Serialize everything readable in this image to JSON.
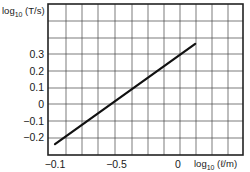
{
  "chart_data": {
    "type": "line",
    "title": "",
    "xlabel": "log10 (ℓ/m)",
    "ylabel": "log10 (T/s)",
    "x_ticks": [
      {
        "value": -1.0,
        "label": "−0.1"
      },
      {
        "value": -0.5,
        "label": "−0.5"
      },
      {
        "value": 0,
        "label": "0"
      }
    ],
    "y_ticks": [
      {
        "value": 0.3,
        "label": "0.3"
      },
      {
        "value": 0.2,
        "label": "0.2"
      },
      {
        "value": 0.1,
        "label": "0.1"
      },
      {
        "value": 0,
        "label": "0"
      },
      {
        "value": -0.1,
        "label": "−0.1"
      },
      {
        "value": -0.2,
        "label": "−0.2"
      }
    ],
    "xlim": [
      -1.06,
      0.52
    ],
    "ylim": [
      -0.3,
      0.6
    ],
    "grid": true,
    "legend": null,
    "series": [
      {
        "name": "log10 T vs log10 ℓ",
        "x": [
          -1.0,
          0.14
        ],
        "y": [
          -0.24,
          0.36
        ]
      }
    ]
  },
  "axes": {
    "ylabel_prefix": "log",
    "ylabel_sub": "10",
    "ylabel_rest": " (T/s)",
    "xlabel_prefix": "log",
    "xlabel_sub": "10",
    "xlabel_rest": " (ℓ/m)"
  },
  "colors": {
    "line": "#111111",
    "grid": "#444444",
    "frame": "#222222"
  }
}
